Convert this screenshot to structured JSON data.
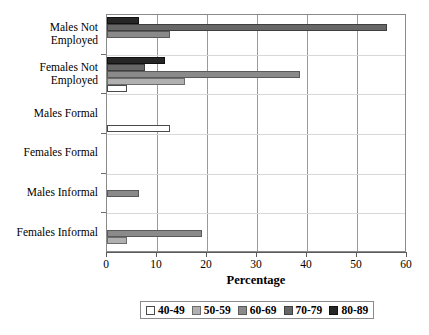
{
  "chart_data": {
    "type": "bar",
    "orientation": "horizontal",
    "title": "",
    "xlabel": "Percentage",
    "ylabel": "",
    "xlim": [
      0,
      60
    ],
    "xticks": [
      0,
      10,
      20,
      30,
      40,
      50,
      60
    ],
    "grid": true,
    "grid_axis": "x",
    "legend_position": "bottom",
    "categories": [
      "Females Informal",
      "Males Informal",
      "Females Formal",
      "Males Formal",
      "Females Not Employed",
      "Males Not Employed"
    ],
    "series": [
      {
        "name": "40-49",
        "color": "#ffffff",
        "values": [
          0,
          0,
          0,
          12.5,
          4.0,
          0
        ]
      },
      {
        "name": "50-59",
        "color": "#b0b0b0",
        "values": [
          4.0,
          0,
          0,
          0,
          15.5,
          0
        ]
      },
      {
        "name": "60-69",
        "color": "#8a8a8a",
        "values": [
          19.0,
          6.3,
          0,
          0,
          38.5,
          12.5
        ]
      },
      {
        "name": "70-79",
        "color": "#676767",
        "values": [
          0,
          0,
          0,
          0,
          7.5,
          56.0
        ]
      },
      {
        "name": "80-89",
        "color": "#262626",
        "values": [
          0,
          0,
          0,
          0,
          11.5,
          6.3
        ]
      }
    ]
  },
  "axis": {
    "x_title": "Percentage",
    "tick_labels": [
      "0",
      "10",
      "20",
      "30",
      "40",
      "50",
      "60"
    ],
    "category_labels": [
      "Males Not\nEmployed",
      "Females Not\nEmployed",
      "Males Formal",
      "Females Formal",
      "Males Informal",
      "Females Informal"
    ]
  },
  "legend": {
    "entries": [
      {
        "label": "40-49",
        "color": "#ffffff",
        "border": "#4a4a4a"
      },
      {
        "label": "50-59",
        "color": "#b0b0b0",
        "border": "#6d6d6d"
      },
      {
        "label": "60-69",
        "color": "#8a8a8a",
        "border": "#5a5a5a"
      },
      {
        "label": "70-79",
        "color": "#676767",
        "border": "#3f3f3f"
      },
      {
        "label": "80-89",
        "color": "#262626",
        "border": "#111111"
      }
    ]
  }
}
